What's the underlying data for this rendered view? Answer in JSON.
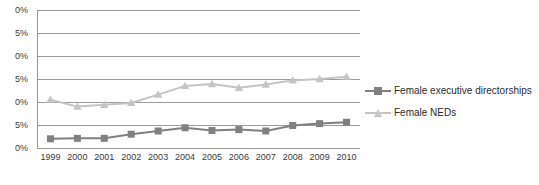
{
  "chart_data": {
    "type": "line",
    "title": "",
    "xlabel": "",
    "ylabel": "",
    "ylim": [
      0,
      30
    ],
    "ytick_labels": [
      "0%",
      "5%",
      "0%",
      "5%",
      "0%",
      "5%",
      "0%"
    ],
    "ytick_values": [
      30,
      25,
      20,
      15,
      10,
      5,
      0
    ],
    "grid": true,
    "legend_position": "right",
    "categories": [
      "1999",
      "2000",
      "2001",
      "2002",
      "2003",
      "2004",
      "2005",
      "2006",
      "2007",
      "2008",
      "2009",
      "2010"
    ],
    "series": [
      {
        "name": "Female executive directorships",
        "color": "#808080",
        "marker": "square",
        "values": [
          2.0,
          2.1,
          2.1,
          3.0,
          3.7,
          4.4,
          3.8,
          4.0,
          3.7,
          4.9,
          5.3,
          5.6
        ]
      },
      {
        "name": "Female NEDs",
        "color": "#c4c4c4",
        "marker": "triangle",
        "values": [
          10.5,
          9.0,
          9.4,
          9.8,
          11.6,
          13.5,
          13.9,
          13.1,
          13.8,
          14.7,
          15.0,
          15.5
        ]
      }
    ]
  },
  "axis": {
    "gridline_color": "#9b9b9b",
    "tick_label_color": "#3a3a3a"
  },
  "legend": {
    "items": [
      {
        "label": "Female executive directorships"
      },
      {
        "label": "Female NEDs"
      }
    ]
  }
}
